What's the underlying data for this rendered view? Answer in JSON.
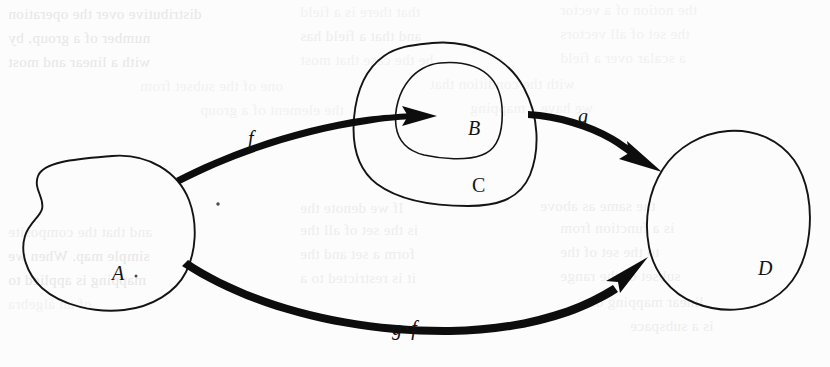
{
  "page": {
    "kind": "scanned-textbook-figure",
    "background_color": "#fcfcfc",
    "ink_color": "#111111",
    "width": 830,
    "height": 367
  },
  "figure": {
    "sets": [
      {
        "id": "A",
        "label": "A",
        "label_x": 112,
        "label_y": 263,
        "role": "domain"
      },
      {
        "id": "B",
        "label": "B",
        "label_x": 468,
        "label_y": 118,
        "role": "image-subset"
      },
      {
        "id": "C",
        "label": "C",
        "label_x": 472,
        "label_y": 175,
        "role": "codomain-of-f"
      },
      {
        "id": "D",
        "label": "D",
        "label_x": 758,
        "label_y": 258,
        "role": "codomain-of-g"
      }
    ],
    "maps": [
      {
        "id": "f",
        "label": "f",
        "from": "A",
        "to": "B",
        "label_x": 248,
        "label_y": 128
      },
      {
        "id": "g",
        "label": "g",
        "from": "C",
        "to": "D",
        "label_x": 578,
        "label_y": 106
      },
      {
        "id": "gof",
        "label_left": "g",
        "compose_symbol": "•",
        "label_right": "f",
        "from": "A",
        "to": "D",
        "label_x": 392,
        "label_y": 318
      }
    ]
  },
  "ghost_text": {
    "note": "faint mirrored show-through from the reverse side of the page",
    "lines": [
      {
        "text": "distributive over the operation",
        "x": 8,
        "y": 6,
        "size": 15,
        "tone": "g1"
      },
      {
        "text": "that there is a field",
        "x": 300,
        "y": 4,
        "size": 15,
        "tone": "g3"
      },
      {
        "text": "the notion of a vector",
        "x": 560,
        "y": 2,
        "size": 15,
        "tone": "g3"
      },
      {
        "text": "number of a group, by",
        "x": 8,
        "y": 30,
        "size": 15,
        "tone": "g1"
      },
      {
        "text": "and that a field has",
        "x": 300,
        "y": 28,
        "size": 15,
        "tone": "g2"
      },
      {
        "text": "the set of all vectors",
        "x": 560,
        "y": 26,
        "size": 15,
        "tone": "g3"
      },
      {
        "text": "with a linear and most",
        "x": 8,
        "y": 54,
        "size": 15,
        "tone": "g1"
      },
      {
        "text": "be the case that most",
        "x": 300,
        "y": 52,
        "size": 15,
        "tone": "g3"
      },
      {
        "text": "a scalar over a field",
        "x": 560,
        "y": 50,
        "size": 15,
        "tone": "g3"
      },
      {
        "text": "one of the subset from",
        "x": 140,
        "y": 78,
        "size": 15,
        "tone": "g3"
      },
      {
        "text": "with the condition that",
        "x": 430,
        "y": 76,
        "size": 15,
        "tone": "g3"
      },
      {
        "text": "the element of a group",
        "x": 200,
        "y": 102,
        "size": 15,
        "tone": "g3"
      },
      {
        "text": "we have a mapping",
        "x": 470,
        "y": 100,
        "size": 15,
        "tone": "g3"
      },
      {
        "text": "If we denote the",
        "x": 300,
        "y": 200,
        "size": 15,
        "tone": "g2"
      },
      {
        "text": "the same as above",
        "x": 540,
        "y": 198,
        "size": 15,
        "tone": "g2"
      },
      {
        "text": "and that the composite",
        "x": 8,
        "y": 224,
        "size": 15,
        "tone": "g2"
      },
      {
        "text": "is the set of all the",
        "x": 300,
        "y": 222,
        "size": 15,
        "tone": "g2"
      },
      {
        "text": "is a function from",
        "x": 560,
        "y": 220,
        "size": 15,
        "tone": "g2"
      },
      {
        "text": "simple map. When we",
        "x": 8,
        "y": 248,
        "size": 15,
        "tone": "g1"
      },
      {
        "text": "form a set and the",
        "x": 300,
        "y": 246,
        "size": 15,
        "tone": "g2"
      },
      {
        "text": "to the set of the",
        "x": 560,
        "y": 244,
        "size": 15,
        "tone": "g2"
      },
      {
        "text": "mapping is applied to",
        "x": 8,
        "y": 272,
        "size": 15,
        "tone": "g1"
      },
      {
        "text": "it is restricted to a",
        "x": 300,
        "y": 270,
        "size": 15,
        "tone": "g2"
      },
      {
        "text": "subset of the range",
        "x": 560,
        "y": 268,
        "size": 15,
        "tone": "g2"
      },
      {
        "text": "of an algebra",
        "x": 8,
        "y": 296,
        "size": 15,
        "tone": "g3"
      },
      {
        "text": "linear mapping of",
        "x": 590,
        "y": 294,
        "size": 15,
        "tone": "g2"
      },
      {
        "text": "is a subspace",
        "x": 630,
        "y": 318,
        "size": 15,
        "tone": "g2"
      }
    ]
  }
}
